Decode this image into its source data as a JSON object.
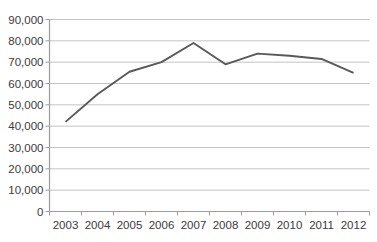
{
  "chart_data": {
    "type": "line",
    "title": "",
    "xlabel": "",
    "ylabel": "",
    "categories": [
      "2003",
      "2004",
      "2005",
      "2006",
      "2007",
      "2008",
      "2009",
      "2010",
      "2011",
      "2012"
    ],
    "series": [
      {
        "name": "",
        "values": [
          42000,
          55000,
          65500,
          70000,
          79000,
          69000,
          74000,
          73000,
          71500,
          65000
        ]
      }
    ],
    "ylim": [
      0,
      90000
    ],
    "ytick_step": 10000,
    "ytick_labels": [
      "0",
      "10,000",
      "20,000",
      "30,000",
      "40,000",
      "50,000",
      "60,000",
      "70,000",
      "80,000",
      "90,000"
    ],
    "grid": "horizontal",
    "legend": "none",
    "colors": {
      "line": "#595959",
      "gridline": "#c3c3c3",
      "axis": "#9d9d9d",
      "text": "#3a3a3a",
      "background": "#ffffff"
    }
  }
}
